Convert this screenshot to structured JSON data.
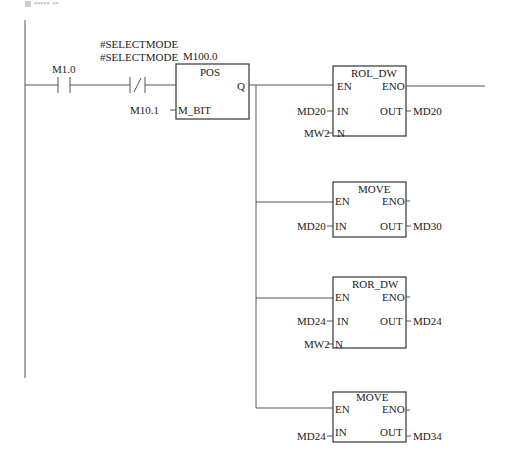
{
  "header": {
    "faint_text": "◼ ▪▪▪▪▪ ▪▪"
  },
  "rung": {
    "contact_no": {
      "address": "M1.0"
    },
    "contact_nc": {
      "address_line1": "#SELECTMODE",
      "address_line2": "#SELECTMODE"
    },
    "pos_block": {
      "address": "M100.0",
      "title": "POS",
      "output_pin": "Q",
      "input_pin": "M_BIT",
      "input_value": "M10.1"
    }
  },
  "blocks": [
    {
      "title": "ROL_DW",
      "en": "EN",
      "eno": "ENO",
      "in_pin": "IN",
      "out_pin": "OUT",
      "n_pin": "N",
      "in_value": "MD20",
      "out_value": "MD20",
      "n_value": "MW2"
    },
    {
      "title": "MOVE",
      "en": "EN",
      "eno": "ENO",
      "in_pin": "IN",
      "out_pin": "OUT",
      "in_value": "MD20",
      "out_value": "MD30"
    },
    {
      "title": "ROR_DW",
      "en": "EN",
      "eno": "ENO",
      "in_pin": "IN",
      "out_pin": "OUT",
      "n_pin": "N",
      "in_value": "MD24",
      "out_value": "MD24",
      "n_value": "MW2"
    },
    {
      "title": "MOVE",
      "en": "EN",
      "eno": "ENO",
      "in_pin": "IN",
      "out_pin": "OUT",
      "in_value": "MD24",
      "out_value": "MD34"
    }
  ]
}
